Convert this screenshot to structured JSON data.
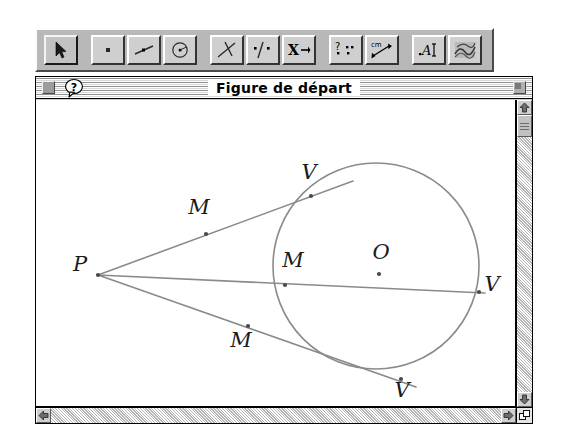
{
  "window": {
    "title": "Figure de départ",
    "close_label": "close-box",
    "help_label": "?",
    "zoom_label": "zoom-box",
    "grow_label": "size-box"
  },
  "toolbar": {
    "tools": [
      {
        "name": "arrow-select-tool",
        "icon": "arrow-cursor-icon",
        "selected": true
      },
      {
        "name": "point-tool",
        "icon": "point-icon",
        "selected": false
      },
      {
        "name": "segment-line-tool",
        "icon": "segment-icon",
        "selected": false
      },
      {
        "name": "circle-tool",
        "icon": "circle-with-center-icon",
        "selected": false
      },
      {
        "name": "perpendicular-tool",
        "icon": "perpendicular-lines-icon",
        "selected": false
      },
      {
        "name": "parallel-tool",
        "icon": "parallel-point-line-icon",
        "selected": false
      },
      {
        "name": "transform-tool",
        "icon": "x-arrow-icon",
        "selected": false
      },
      {
        "name": "query-tool",
        "icon": "question-points-icon",
        "selected": false
      },
      {
        "name": "measure-tool",
        "icon": "cm-ruler-arrow-icon",
        "selected": false
      },
      {
        "name": "text-tool",
        "icon": "a-text-cursor-icon",
        "selected": false
      },
      {
        "name": "fill-display-tool",
        "icon": "scribble-fill-icon",
        "selected": false
      }
    ]
  },
  "scrollbars": {
    "up_arrow": "scroll-up-arrow-icon",
    "down_arrow": "scroll-down-arrow-icon",
    "left_arrow": "scroll-left-arrow-icon",
    "right_arrow": "scroll-right-arrow-icon"
  },
  "figure": {
    "stroke_color": "#8a8a8a",
    "label_color": "#1a1a1a",
    "background": "#ffffff",
    "circle": {
      "cx": 340,
      "cy": 166,
      "r": 103
    },
    "points": [
      {
        "id": "P",
        "label": "P",
        "x": 62,
        "y": 175,
        "label_x": 44,
        "label_y": 171
      },
      {
        "id": "M1",
        "label": "M",
        "x": 170,
        "y": 134,
        "label_x": 163,
        "label_y": 114
      },
      {
        "id": "V1",
        "label": "V",
        "x": 275,
        "y": 96,
        "label_x": 273,
        "label_y": 79
      },
      {
        "id": "M2",
        "label": "M",
        "x": 249,
        "y": 185,
        "label_x": 257,
        "label_y": 167
      },
      {
        "id": "O",
        "label": "O",
        "x": 343,
        "y": 174,
        "label_x": 345,
        "label_y": 159
      },
      {
        "id": "V2",
        "label": "V",
        "x": 443,
        "y": 192,
        "label_x": 456,
        "label_y": 191
      },
      {
        "id": "M3",
        "label": "M",
        "x": 212,
        "y": 226,
        "label_x": 205,
        "label_y": 247
      },
      {
        "id": "V3",
        "label": "V",
        "x": 365,
        "y": 279,
        "label_x": 366,
        "label_y": 297
      }
    ],
    "lines": [
      {
        "id": "upper-ray",
        "x1": 62,
        "y1": 175,
        "x2": 317,
        "y2": 81
      },
      {
        "id": "middle-ray",
        "x1": 62,
        "y1": 175,
        "x2": 449,
        "y2": 193
      },
      {
        "id": "lower-ray",
        "x1": 62,
        "y1": 175,
        "x2": 380,
        "y2": 287
      }
    ]
  }
}
